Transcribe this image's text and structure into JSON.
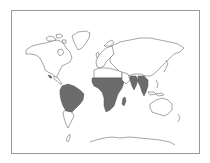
{
  "map": {
    "type": "world-outline-map",
    "colors": {
      "background": "#ffffff",
      "frame": "#9a9a9a",
      "outline": "#6a6a6a",
      "shaded_region": "#6b6b6b"
    },
    "shaded_regions": [
      "south-america-tropics",
      "central-america",
      "sub-saharan-africa",
      "madagascar",
      "india",
      "southeast-asia"
    ],
    "unshaded_regions": [
      "north-america",
      "greenland",
      "europe",
      "north-africa",
      "asia",
      "australia",
      "new-zealand",
      "antarctica",
      "southern-south-america"
    ]
  }
}
